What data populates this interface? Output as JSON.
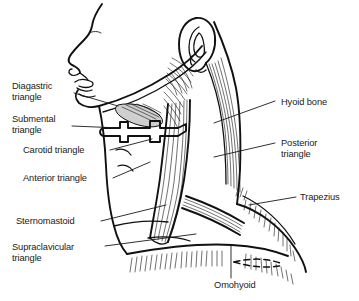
{
  "figure": {
    "background_color": "#ffffff",
    "ink_color": "#111111",
    "width": 359,
    "height": 301
  },
  "labels": {
    "left": [
      {
        "id": "digastric",
        "line1": "Diagastric",
        "line2": "triangle",
        "x": 12,
        "y": 89,
        "leader": "M74,93 L118,106"
      },
      {
        "id": "submental",
        "line1": "Submental",
        "line2": "triangle",
        "x": 12,
        "y": 122,
        "leader": "M72,126 L120,128"
      },
      {
        "id": "carotid",
        "line1": "Carotid triangle",
        "line2": "",
        "x": 23,
        "y": 153,
        "leader": "M110,150 L152,139"
      },
      {
        "id": "anterior",
        "line1": "Anterior triangle",
        "line2": "",
        "x": 23,
        "y": 181,
        "leader": "M113,178 L150,162"
      },
      {
        "id": "sternomastoid",
        "line1": "Sternomastoid",
        "line2": "",
        "x": 16,
        "y": 224,
        "leader": "M101,221 L166,205"
      },
      {
        "id": "supraclavicular",
        "line1": "Supraclavicular",
        "line2": "triangle",
        "x": 12,
        "y": 250,
        "leader": "M105,246 L196,234"
      }
    ],
    "right": [
      {
        "id": "hyoid-bone",
        "line1": "Hyoid bone",
        "line2": "",
        "x": 281,
        "y": 105,
        "leader": "M275,101 L214,123"
      },
      {
        "id": "posterior",
        "line1": "Posterior",
        "line2": "triangle",
        "x": 281,
        "y": 146,
        "leader": "M275,143 L214,157"
      },
      {
        "id": "trapezius",
        "line1": "Trapezius",
        "line2": "",
        "x": 300,
        "y": 200,
        "leader": "M296,197 L249,205"
      }
    ],
    "bottom": [
      {
        "id": "omohyoid",
        "line1": "Omohyoid",
        "line2": "",
        "x": 214,
        "y": 288,
        "leader": "M231,278 L231,245"
      }
    ]
  },
  "structures": [
    {
      "id": "head-profile",
      "name": "Head profile (forehead, nose, lips, chin)"
    },
    {
      "id": "ear",
      "name": "External ear (auricle)"
    },
    {
      "id": "mandible",
      "name": "Mandible / jaw line"
    },
    {
      "id": "hyoid-bone-shape",
      "name": "Hyoid bone"
    },
    {
      "id": "digastric-muscle",
      "name": "Digastric muscle (shaded)"
    },
    {
      "id": "sternomastoid-muscle",
      "name": "Sternomastoid muscle"
    },
    {
      "id": "trapezius-muscle",
      "name": "Trapezius muscle (hatched)"
    },
    {
      "id": "omohyoid-muscle",
      "name": "Omohyoid muscle"
    },
    {
      "id": "clavicle",
      "name": "Clavicle (dashed outline)"
    }
  ]
}
